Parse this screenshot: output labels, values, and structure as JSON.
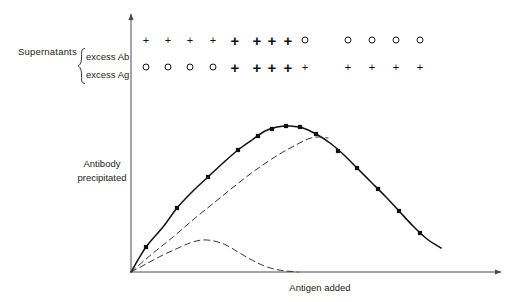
{
  "figure": {
    "axes": {
      "ylabel_line1": "Antibody",
      "ylabel_line2": "precipitated",
      "xlabel": "Antigen added",
      "y_axis_arrow": true,
      "x_axis_arrow": true,
      "origin": [
        131,
        272
      ],
      "x_axis_end": [
        505,
        272
      ],
      "y_axis_top": [
        131,
        10
      ],
      "grid": false,
      "tick_labels": []
    },
    "legend": {
      "group_label": "Supernatants",
      "brace": "{",
      "rows": [
        {
          "name": "excess-ab",
          "label": "excess Ab"
        },
        {
          "name": "excess-ag",
          "label": "excess Ag"
        }
      ]
    },
    "supernatant_table": {
      "column_x": [
        146,
        168,
        190,
        213,
        235,
        257,
        272,
        288,
        305,
        348,
        372,
        396,
        420
      ],
      "excess_ab": [
        "+",
        "+",
        "+",
        "+",
        "++",
        "++",
        "++",
        "++",
        "o",
        "o",
        "o",
        "o",
        "o"
      ],
      "excess_ag": [
        "o",
        "o",
        "o",
        "o",
        "++",
        "++",
        "++",
        "++",
        "+",
        "+",
        "+",
        "+",
        "+"
      ],
      "symbol_key": {
        "+": "weak-positive",
        "++": "strong-positive",
        "o": "negative"
      }
    },
    "colors": {
      "ink": "#1a1a1a",
      "axis": "#4a4a4a",
      "curve_solid": "#111111",
      "curve_dashed": "#333333",
      "background": "#ffffff"
    }
  },
  "chart_data": {
    "type": "line",
    "title": "",
    "xlabel": "Antigen added",
    "ylabel": "Antibody precipitated",
    "xlim": [
      131,
      505
    ],
    "ylim": [
      272,
      10
    ],
    "grid": false,
    "legend_position": "none",
    "axis_units": "arbitrary units (unlabelled axes)",
    "series": [
      {
        "name": "total-antibody-precipitated",
        "style": "solid",
        "markers": "filled-square",
        "points": [
          [
            131,
            272
          ],
          [
            146,
            247
          ],
          [
            163,
            227
          ],
          [
            177,
            208
          ],
          [
            192,
            192
          ],
          [
            208,
            177
          ],
          [
            223,
            163
          ],
          [
            238,
            150
          ],
          [
            252,
            140
          ],
          [
            265,
            131
          ],
          [
            277,
            127
          ],
          [
            290,
            126
          ],
          [
            303,
            128
          ],
          [
            316,
            134
          ],
          [
            330,
            143
          ],
          [
            344,
            155
          ],
          [
            357,
            168
          ],
          [
            371,
            182
          ],
          [
            385,
            196
          ],
          [
            399,
            211
          ],
          [
            413,
            226
          ],
          [
            427,
            239
          ],
          [
            441,
            248
          ]
        ],
        "marker_points": [
          [
            146,
            247
          ],
          [
            177,
            208
          ],
          [
            208,
            177
          ],
          [
            238,
            150
          ],
          [
            258,
            136
          ],
          [
            272,
            129
          ],
          [
            286,
            126
          ],
          [
            300,
            127
          ],
          [
            316,
            134
          ],
          [
            338,
            151
          ],
          [
            357,
            168
          ],
          [
            378,
            189
          ],
          [
            399,
            211
          ],
          [
            420,
            233
          ]
        ]
      },
      {
        "name": "antibody-in-complex-middle",
        "style": "dashed",
        "markers": "none",
        "points": [
          [
            131,
            272
          ],
          [
            152,
            254
          ],
          [
            173,
            237
          ],
          [
            194,
            219
          ],
          [
            215,
            202
          ],
          [
            236,
            185
          ],
          [
            257,
            169
          ],
          [
            278,
            155
          ],
          [
            294,
            146
          ],
          [
            308,
            139
          ],
          [
            318,
            137
          ],
          [
            328,
            138
          ]
        ]
      },
      {
        "name": "free-antigen-lower",
        "style": "dashed",
        "markers": "none",
        "points": [
          [
            131,
            272
          ],
          [
            146,
            264
          ],
          [
            161,
            256
          ],
          [
            176,
            249
          ],
          [
            190,
            243
          ],
          [
            202,
            240
          ],
          [
            214,
            241
          ],
          [
            226,
            245
          ],
          [
            238,
            252
          ],
          [
            250,
            259
          ],
          [
            262,
            265
          ],
          [
            274,
            269
          ],
          [
            286,
            271
          ],
          [
            298,
            272
          ]
        ]
      }
    ]
  }
}
